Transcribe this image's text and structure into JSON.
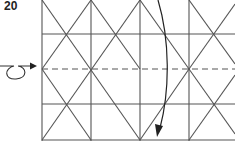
{
  "diagram": {
    "step_number": "20",
    "symbols": {
      "turn_over_arrow": "loop-arrow",
      "fold_arrow": "curved-arrow-down",
      "valley_fold": "dashed-line"
    },
    "colors": {
      "line": "#555555",
      "arrow": "#222222",
      "background": "#ffffff"
    }
  }
}
